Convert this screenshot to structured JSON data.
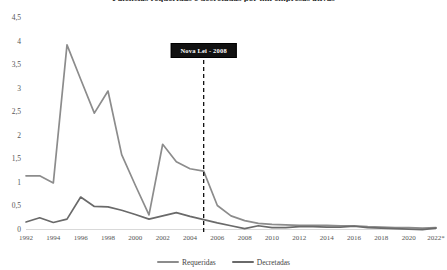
{
  "chart_data": {
    "type": "line",
    "title": "Falências requeridas e decretadas por mil empresas ativas",
    "xlabel": "",
    "ylabel": "",
    "ylim": [
      0,
      4.5
    ],
    "ytick_labels": [
      "4,5",
      "4",
      "3,5",
      "3",
      "2,5",
      "2",
      "1,5",
      "1",
      "0,5",
      "0"
    ],
    "ytick_values": [
      4.5,
      4,
      3.5,
      3,
      2.5,
      2,
      1.5,
      1,
      0.5,
      0
    ],
    "xtick_labels": [
      "1992",
      "1994",
      "1996",
      "1998",
      "2000",
      "2002",
      "2004",
      "2006",
      "2008",
      "2010",
      "2012",
      "2014",
      "2016",
      "2018",
      "2020",
      "2022*"
    ],
    "grid": false,
    "legend_position": "bottom",
    "x": [
      1992,
      1993,
      1994,
      1995,
      1996,
      1997,
      1998,
      1999,
      2000,
      2001,
      2002,
      2003,
      2004,
      2005,
      2006,
      2007,
      2008,
      2009,
      2010,
      2011,
      2012,
      2013,
      2014,
      2015,
      2016,
      2017,
      2018,
      2019,
      2020,
      2021,
      2022
    ],
    "series": [
      {
        "name": "Requeridas",
        "color": "#8c8c8c",
        "values": [
          1.15,
          1.15,
          1.0,
          3.93,
          3.2,
          2.48,
          2.95,
          1.6,
          0.95,
          0.32,
          1.82,
          1.45,
          1.3,
          1.25,
          0.52,
          0.3,
          0.2,
          0.14,
          0.12,
          0.11,
          0.1,
          0.1,
          0.1,
          0.09,
          0.09,
          0.07,
          0.06,
          0.05,
          0.05,
          0.04,
          0.05
        ]
      },
      {
        "name": "Decretadas",
        "color": "#6a6a6a",
        "values": [
          0.17,
          0.26,
          0.16,
          0.23,
          0.7,
          0.5,
          0.49,
          0.42,
          0.33,
          0.23,
          0.3,
          0.37,
          0.29,
          0.22,
          0.15,
          0.09,
          0.03,
          0.09,
          0.05,
          0.05,
          0.07,
          0.07,
          0.06,
          0.06,
          0.08,
          0.05,
          0.04,
          0.03,
          0.02,
          0.01,
          0.04
        ]
      }
    ],
    "annotations": [
      {
        "label": "Nova Lei - 2008",
        "x": 2005,
        "line_style": "dashed",
        "box_color": "#111111",
        "text_color": "#ffffff"
      }
    ]
  }
}
